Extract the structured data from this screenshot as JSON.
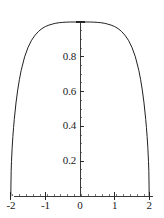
{
  "chart_data": {
    "type": "line",
    "title": "",
    "subtitle": "",
    "xlabel": "",
    "ylabel": "",
    "grid": false,
    "legend": false,
    "legend_position": "none",
    "xlim": [
      -2.15,
      2.15
    ],
    "ylim": [
      -0.06,
      1.06
    ],
    "x_ticks": [
      -2,
      -1,
      0,
      1,
      2
    ],
    "x_tick_labels": [
      "-2",
      "-1",
      "0",
      "1",
      "2"
    ],
    "y_ticks": [
      0.2,
      0.4,
      0.6,
      0.8,
      1.0
    ],
    "y_tick_labels": [
      "0.2",
      "0.4",
      "0.6",
      "0.8",
      ""
    ],
    "x_minor_tick_step": 0.2,
    "y_minor_tick_step": 0.05,
    "axis_style": "centered-cross",
    "line_color": "#231f20",
    "axis_color": "#3a3a3a",
    "line_width": 1.0,
    "series": [
      {
        "name": "curve",
        "description": "dome-shaped curve peaking at (0, 1) and meeting y=0 vertically at x = -2 and x = 2",
        "x": [
          -2.0,
          -1.99,
          -1.98,
          -1.96,
          -1.94,
          -1.92,
          -1.9,
          -1.85,
          -1.8,
          -1.75,
          -1.7,
          -1.6,
          -1.5,
          -1.4,
          -1.3,
          -1.2,
          -1.1,
          -1.0,
          -0.9,
          -0.8,
          -0.7,
          -0.6,
          -0.5,
          -0.4,
          -0.3,
          -0.2,
          -0.1,
          0.0,
          0.1,
          0.2,
          0.3,
          0.4,
          0.5,
          0.6,
          0.7,
          0.8,
          0.9,
          1.0,
          1.1,
          1.2,
          1.3,
          1.4,
          1.5,
          1.6,
          1.7,
          1.75,
          1.8,
          1.85,
          1.9,
          1.92,
          1.94,
          1.96,
          1.98,
          1.99,
          2.0
        ],
        "y": [
          0.0,
          0.141,
          0.199,
          0.28,
          0.342,
          0.394,
          0.439,
          0.535,
          0.61,
          0.671,
          0.722,
          0.8,
          0.855,
          0.895,
          0.924,
          0.946,
          0.962,
          0.974,
          0.982,
          0.988,
          0.993,
          0.996,
          0.998,
          0.999,
          1.0,
          1.0,
          1.0,
          1.0,
          1.0,
          1.0,
          1.0,
          0.999,
          0.998,
          0.996,
          0.993,
          0.988,
          0.982,
          0.974,
          0.962,
          0.946,
          0.924,
          0.895,
          0.855,
          0.8,
          0.722,
          0.671,
          0.61,
          0.535,
          0.439,
          0.394,
          0.342,
          0.28,
          0.199,
          0.141,
          0.0
        ]
      }
    ]
  },
  "axes": {
    "y_labels": [
      {
        "text": "0.8",
        "value": 0.8
      },
      {
        "text": "0.6",
        "value": 0.6
      },
      {
        "text": "0.4",
        "value": 0.4
      },
      {
        "text": "0.2",
        "value": 0.2
      }
    ],
    "x_labels": [
      {
        "text": "-2",
        "value": -2
      },
      {
        "text": "-1",
        "value": -1
      },
      {
        "text": "0",
        "value": 0
      },
      {
        "text": "1",
        "value": 1
      },
      {
        "text": "2",
        "value": 2
      }
    ]
  }
}
